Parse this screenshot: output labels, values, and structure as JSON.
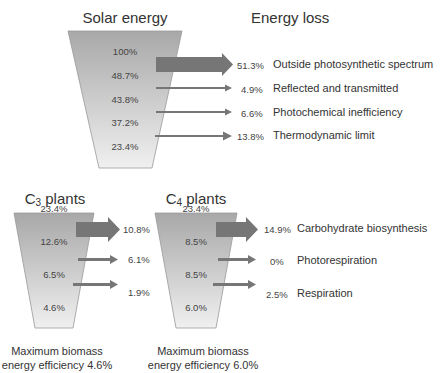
{
  "headers": {
    "solar": "Solar energy",
    "loss": "Energy loss",
    "c3_prefix": "C",
    "c3_sub": "3",
    "c3_suffix": " plants",
    "c4_prefix": "C",
    "c4_sub": "4",
    "c4_suffix": " plants"
  },
  "solar_funnel": {
    "levels": [
      "100%",
      "48.7%",
      "43.8%",
      "37.2%",
      "23.4%"
    ]
  },
  "energy_losses": [
    {
      "value": "51.3%",
      "label": "Outside photosynthetic spectrum"
    },
    {
      "value": "4.9%",
      "label": "Reflected and transmitted"
    },
    {
      "value": "6.6%",
      "label": "Photochemical inefficiency"
    },
    {
      "value": "13.8%",
      "label": "Thermodynamic limit"
    }
  ],
  "c3_funnel": {
    "levels": [
      "23.4%",
      "12.6%",
      "6.5%",
      "4.6%"
    ],
    "losses": [
      "10.8%",
      "6.1%",
      "1.9%"
    ],
    "caption_line1": "Maximum biomass",
    "caption_line2": "energy efficiency 4.6%"
  },
  "c4_funnel": {
    "levels": [
      "23.4%",
      "8.5%",
      "8.5%",
      "6.0%"
    ],
    "losses": [
      "14.9%",
      "0%",
      "2.5%"
    ],
    "caption_line1": "Maximum biomass",
    "caption_line2": "energy efficiency 6.0%"
  },
  "c_losses_labels": [
    "Carbohydrate biosynthesis",
    "Photorespiration",
    "Respiration"
  ],
  "colors": {
    "funnel_top": "#a9a9a9",
    "funnel_bottom": "#eeeeee",
    "arrow": "#777777"
  }
}
